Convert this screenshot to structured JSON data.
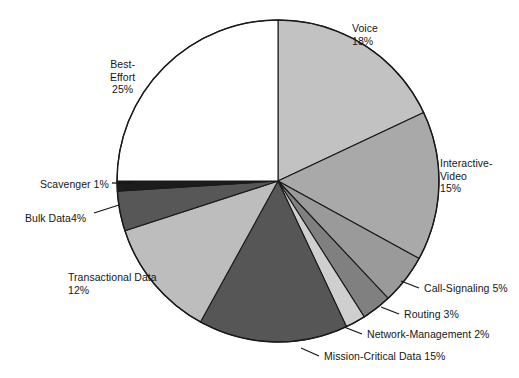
{
  "chart_data": {
    "type": "pie",
    "title": "",
    "subtitle": "",
    "xlabel": "",
    "ylabel": "",
    "legend_position": "none",
    "grid": false,
    "start_angle_deg": 0,
    "direction": "clockwise",
    "units": "%",
    "categories": [
      "Voice",
      "Interactive-Video",
      "Call-Signaling",
      "Routing",
      "Network-Management",
      "Mission-Critical Data",
      "Transactional Data",
      "Bulk Data",
      "Scavenger",
      "Best-Effort"
    ],
    "values": [
      18,
      15,
      5,
      3,
      2,
      15,
      12,
      4,
      1,
      25
    ],
    "slices": [
      {
        "name": "Voice",
        "value": 18,
        "label_lines": [
          "Voice",
          "18%"
        ],
        "color": "#c2c2c2",
        "label_x": 352,
        "label_y": 22,
        "align": "left",
        "leader": false
      },
      {
        "name": "Interactive-Video",
        "value": 15,
        "label_lines": [
          "Interactive-",
          "Video",
          "15%"
        ],
        "color": "#a9a9a9",
        "label_x": 440,
        "label_y": 157,
        "align": "left",
        "leader": false
      },
      {
        "name": "Call-Signaling",
        "value": 5,
        "label_lines": [
          "Call-Signaling 5%"
        ],
        "color": "#9a9a9a",
        "label_x": 424,
        "label_y": 282,
        "align": "left",
        "leader": true,
        "leader_x1": 401,
        "leader_y1": 281,
        "leader_x2": 419,
        "leader_y2": 288
      },
      {
        "name": "Routing",
        "value": 3,
        "label_lines": [
          "Routing 3%"
        ],
        "color": "#808080",
        "label_x": 404,
        "label_y": 308,
        "align": "left",
        "leader": true,
        "leader_x1": 381,
        "leader_y1": 307,
        "leader_x2": 399,
        "leader_y2": 314
      },
      {
        "name": "Network-Management",
        "value": 2,
        "label_lines": [
          "Network-Management 2%"
        ],
        "color": "#cfcfcf",
        "label_x": 367,
        "label_y": 328,
        "align": "left",
        "leader": true,
        "leader_x1": 344,
        "leader_y1": 327,
        "leader_x2": 362,
        "leader_y2": 334
      },
      {
        "name": "Mission-Critical Data",
        "value": 15,
        "label_lines": [
          "Mission-Critical Data 15%"
        ],
        "color": "#565656",
        "label_x": 324,
        "label_y": 350,
        "align": "left",
        "leader": true,
        "leader_x1": 301,
        "leader_y1": 348,
        "leader_x2": 319,
        "leader_y2": 356
      },
      {
        "name": "Transactional Data",
        "value": 12,
        "label_lines": [
          "Transactional Data",
          "12%"
        ],
        "color": "#bdbdbd",
        "label_x": 68,
        "label_y": 271,
        "align": "left",
        "leader": false
      },
      {
        "name": "Bulk Data",
        "value": 4,
        "label_lines": [
          "Bulk Data4%"
        ],
        "color": "#575757",
        "label_x": 25,
        "label_y": 212,
        "align": "left",
        "leader": true,
        "leader_x1": 94,
        "leader_y1": 213,
        "leader_x2": 119,
        "leader_y2": 205
      },
      {
        "name": "Scavenger",
        "value": 1,
        "label_lines": [
          "Scavenger 1%"
        ],
        "color": "#1c1c1c",
        "label_x": 40,
        "label_y": 178,
        "align": "left",
        "leader": true,
        "leader_x1": 112,
        "leader_y1": 183,
        "leader_x2": 134,
        "leader_y2": 183
      },
      {
        "name": "Best-Effort",
        "value": 25,
        "label_lines": [
          "Best-",
          "Effort",
          "25%"
        ],
        "color": "#ffffff",
        "label_x": 110,
        "label_y": 58,
        "align": "center",
        "leader": false
      }
    ],
    "geometry": {
      "center_x": 278,
      "center_y": 181,
      "radius": 161,
      "outline_color": "#1a1a1a",
      "outline_width": 1.4
    }
  }
}
